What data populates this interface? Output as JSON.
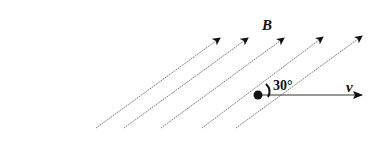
{
  "diagram": {
    "field_label": "B",
    "velocity_label": "v",
    "angle_label": "30°",
    "field_lines": [
      {
        "x1": 96,
        "y1": 128,
        "x2": 220,
        "y2": 38
      },
      {
        "x1": 124,
        "y1": 128,
        "x2": 248,
        "y2": 38
      },
      {
        "x1": 161,
        "y1": 128,
        "x2": 284,
        "y2": 38
      },
      {
        "x1": 202,
        "y1": 128,
        "x2": 323,
        "y2": 37
      },
      {
        "x1": 236,
        "y1": 128,
        "x2": 362,
        "y2": 36
      }
    ],
    "particle": {
      "cx": 258,
      "cy": 95,
      "r": 4.5
    },
    "velocity_arrow": {
      "x1": 258,
      "y1": 95,
      "x2": 362,
      "y2": 95
    },
    "colors": {
      "line": "#555555",
      "ink": "#111111"
    }
  }
}
